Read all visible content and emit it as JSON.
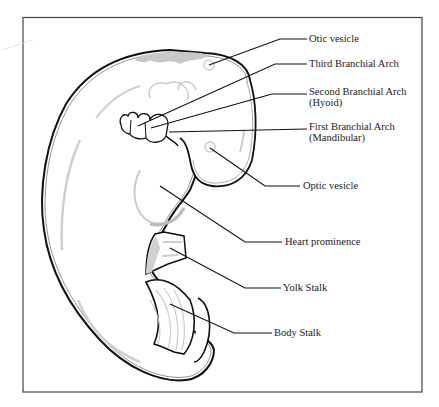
{
  "diagram": {
    "colors": {
      "outline": "#111111",
      "shade": "#c8c8c8",
      "frame": "#444444",
      "background": "#ffffff"
    },
    "labels": [
      {
        "id": "otic-vesicle",
        "lines": [
          "Otic vesicle"
        ]
      },
      {
        "id": "third-branchial-arch",
        "lines": [
          "Third Branchial Arch"
        ]
      },
      {
        "id": "second-branchial-arch",
        "lines": [
          "Second Branchial Arch",
          "(Hyoid)"
        ]
      },
      {
        "id": "first-branchial-arch",
        "lines": [
          "First Branchial Arch",
          "(Mandibular)"
        ]
      },
      {
        "id": "optic-vesicle",
        "lines": [
          "Optic vesicle"
        ]
      },
      {
        "id": "heart-prominence",
        "lines": [
          "Heart prominence"
        ]
      },
      {
        "id": "yolk-stalk",
        "lines": [
          "Yolk Stalk"
        ]
      },
      {
        "id": "body-stalk",
        "lines": [
          "Body Stalk"
        ]
      }
    ]
  }
}
